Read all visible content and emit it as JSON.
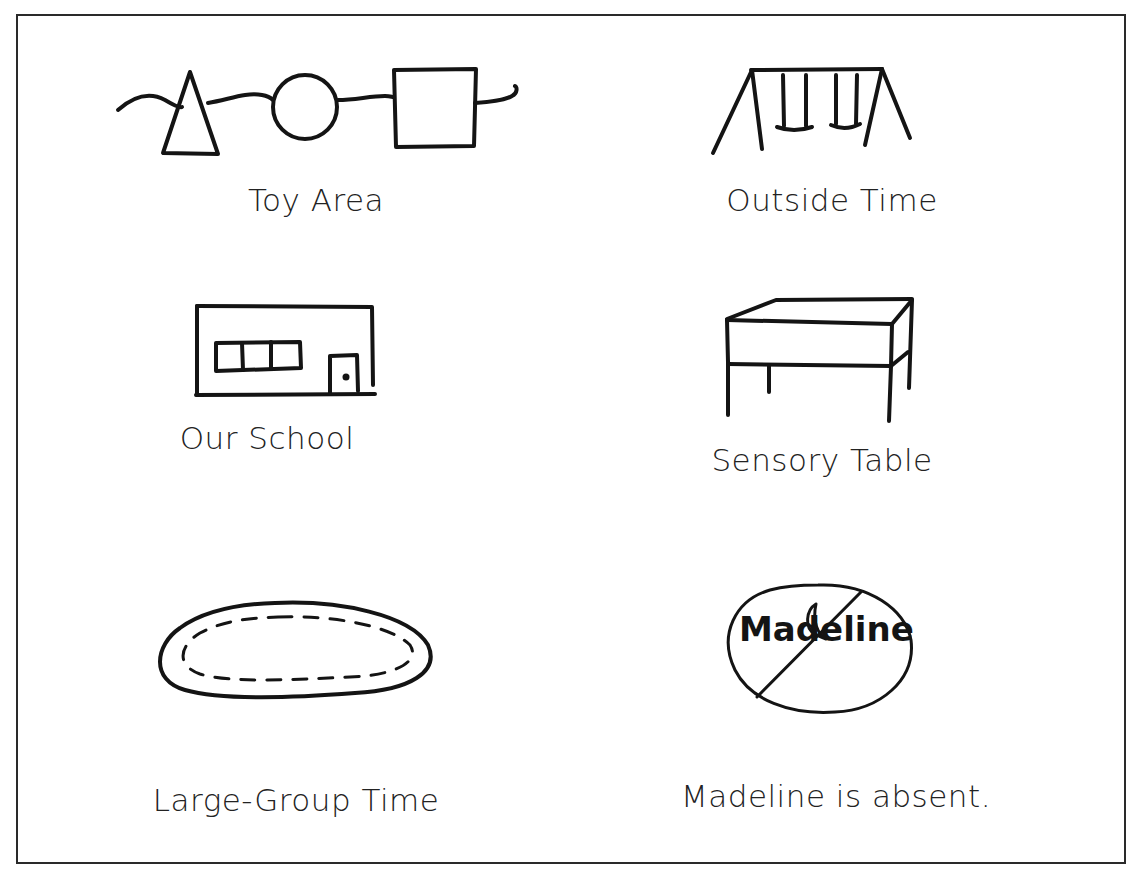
{
  "page": {
    "background": "#ffffff",
    "frame_color": "#2a2a2a",
    "stroke_color": "#141414"
  },
  "symbols": [
    {
      "id": "toy-area",
      "label": "Toy Area",
      "icon": "shapes-on-line-icon",
      "description": "Triangle, circle and square connected by a wavy line"
    },
    {
      "id": "outside-time",
      "label": "Outside Time",
      "icon": "swing-set-icon",
      "description": "A-frame swing set with two swings"
    },
    {
      "id": "our-school",
      "label": "Our School",
      "icon": "school-building-icon",
      "description": "Rectangular building with three-pane window and door"
    },
    {
      "id": "sensory-table",
      "label": "Sensory Table",
      "icon": "table-icon",
      "description": "Box-shaped table drawn in perspective with four legs"
    },
    {
      "id": "large-group-time",
      "label": "Large-Group Time",
      "icon": "rug-oval-icon",
      "description": "Oval rug with dashed inner border"
    },
    {
      "id": "madeline-absent",
      "label": "Madeline is absent.",
      "icon": "absent-name-icon",
      "inner_text": "Madeline",
      "description": "Circle with name Madeline, moon symbol, crossed out by diagonal line"
    }
  ]
}
